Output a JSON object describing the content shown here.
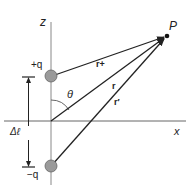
{
  "diagram": {
    "axes": {
      "z_label": "z",
      "x_label": "x"
    },
    "charges": {
      "positive": "+q",
      "negative": "−q"
    },
    "point": "P",
    "vectors": {
      "r_plus": "r+",
      "r": "r",
      "r_minus": "r′"
    },
    "angle": "θ",
    "separation": "Δℓ",
    "colors": {
      "line": "#222222",
      "axis": "#888888",
      "charge_fill": "#9a9a9a",
      "charge_stroke": "#666666"
    }
  }
}
